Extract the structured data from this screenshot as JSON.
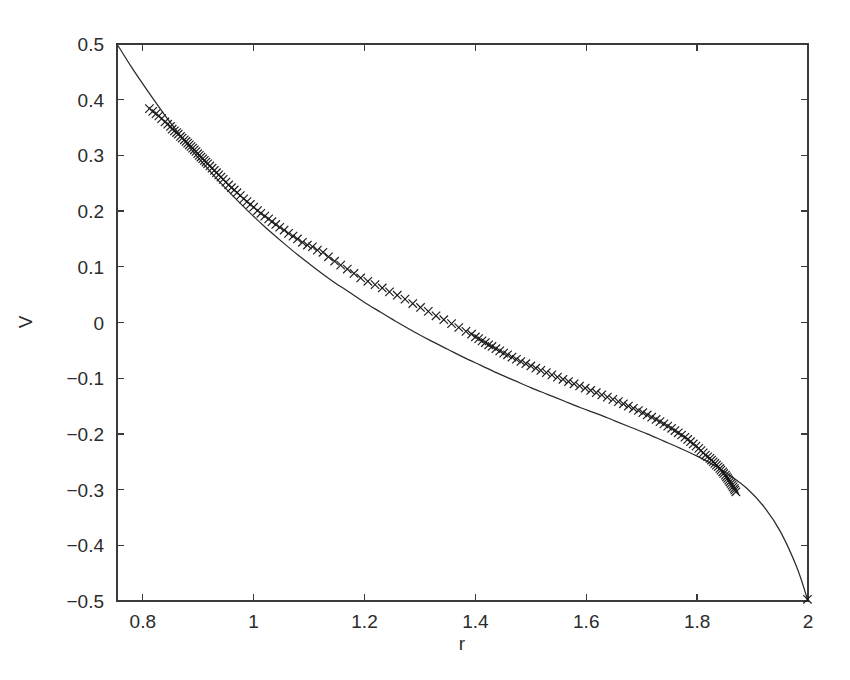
{
  "chart_data": {
    "type": "scatter",
    "title": "",
    "xlabel": "r",
    "ylabel": "V",
    "xlim": [
      0.7535,
      2.0
    ],
    "ylim": [
      -0.5,
      0.5
    ],
    "grid": false,
    "legend": null,
    "xticks": [
      0.8,
      1.0,
      1.2,
      1.4,
      1.6,
      1.8,
      2.0
    ],
    "xticklabels": [
      "0.8",
      "1",
      "1.2",
      "1.4",
      "1.6",
      "1.8",
      "2"
    ],
    "yticks": [
      -0.5,
      -0.4,
      -0.3,
      -0.2,
      -0.1,
      0.0,
      0.1,
      0.2,
      0.3,
      0.4,
      0.5
    ],
    "yticklabels": [
      "−0.5",
      "−0.4",
      "−0.3",
      "−0.2",
      "−0.1",
      "0",
      "0.1",
      "0.2",
      "0.3",
      "0.4",
      "0.5"
    ],
    "series": [
      {
        "name": "fit curve",
        "type": "line",
        "marker": "none",
        "linestyle": "solid",
        "color": "#2b2b2b",
        "x": [
          0.7535,
          0.78,
          0.81,
          0.84,
          0.87,
          0.9,
          0.93,
          0.96,
          0.99,
          1.02,
          1.05,
          1.08,
          1.11,
          1.14,
          1.17,
          1.2,
          1.23,
          1.26,
          1.29,
          1.32,
          1.35,
          1.38,
          1.41,
          1.44,
          1.47,
          1.5,
          1.53,
          1.56,
          1.59,
          1.62,
          1.65,
          1.68,
          1.71,
          1.74,
          1.77,
          1.8,
          1.83,
          1.86,
          1.89,
          1.92,
          1.95,
          1.98,
          2.0
        ],
        "y": [
          0.5,
          0.458,
          0.414,
          0.372,
          0.333,
          0.296,
          0.262,
          0.23,
          0.2,
          0.172,
          0.146,
          0.121,
          0.098,
          0.076,
          0.056,
          0.036,
          0.018,
          0.0,
          -0.017,
          -0.033,
          -0.048,
          -0.063,
          -0.077,
          -0.091,
          -0.104,
          -0.117,
          -0.129,
          -0.141,
          -0.153,
          -0.164,
          -0.176,
          -0.188,
          -0.2,
          -0.213,
          -0.226,
          -0.24,
          -0.256,
          -0.275,
          -0.298,
          -0.33,
          -0.375,
          -0.44,
          -0.5
        ]
      },
      {
        "name": "data points",
        "type": "scatter",
        "marker": "x",
        "color": "#1a1a1a",
        "x": [
          0.812,
          0.818,
          0.824,
          0.829,
          0.834,
          0.84,
          0.845,
          0.85,
          0.853,
          0.857,
          0.861,
          0.864,
          0.868,
          0.871,
          0.875,
          0.878,
          0.881,
          0.884,
          0.887,
          0.89,
          0.893,
          0.896,
          0.899,
          0.902,
          0.905,
          0.908,
          0.911,
          0.914,
          0.917,
          0.921,
          0.925,
          0.929,
          0.933,
          0.937,
          0.941,
          0.945,
          0.95,
          0.955,
          0.96,
          0.965,
          0.97,
          0.976,
          0.982,
          0.988,
          0.994,
          1.0,
          1.007,
          1.013,
          1.02,
          1.027,
          1.033,
          1.04,
          1.047,
          1.055,
          1.063,
          1.071,
          1.079,
          1.088,
          1.097,
          1.106,
          1.115,
          1.125,
          1.135,
          1.146,
          1.157,
          1.169,
          1.181,
          1.193,
          1.206,
          1.219,
          1.232,
          1.245,
          1.259,
          1.273,
          1.287,
          1.301,
          1.315,
          1.329,
          1.343,
          1.357,
          1.37,
          1.383,
          1.393,
          1.4,
          1.406,
          1.412,
          1.418,
          1.424,
          1.43,
          1.437,
          1.444,
          1.451,
          1.458,
          1.466,
          1.474,
          1.482,
          1.491,
          1.5,
          1.509,
          1.518,
          1.528,
          1.538,
          1.548,
          1.558,
          1.568,
          1.578,
          1.588,
          1.598,
          1.608,
          1.618,
          1.628,
          1.638,
          1.648,
          1.658,
          1.667,
          1.676,
          1.685,
          1.694,
          1.702,
          1.71,
          1.718,
          1.726,
          1.733,
          1.74,
          1.747,
          1.754,
          1.76,
          1.766,
          1.772,
          1.778,
          1.783,
          1.788,
          1.793,
          1.798,
          1.803,
          1.807,
          1.811,
          1.815,
          1.819,
          1.823,
          1.826,
          1.829,
          1.832,
          1.835,
          1.838,
          1.841,
          1.843,
          1.846,
          1.848,
          1.851,
          1.853,
          1.855,
          1.857,
          1.859,
          1.861,
          1.863,
          1.865,
          1.867,
          1.868,
          1.87,
          1.999
        ],
        "y": [
          0.384,
          0.379,
          0.375,
          0.371,
          0.366,
          0.36,
          0.356,
          0.352,
          0.347,
          0.344,
          0.341,
          0.338,
          0.334,
          0.331,
          0.328,
          0.325,
          0.322,
          0.319,
          0.316,
          0.313,
          0.31,
          0.307,
          0.303,
          0.3,
          0.297,
          0.294,
          0.291,
          0.288,
          0.285,
          0.281,
          0.277,
          0.273,
          0.269,
          0.265,
          0.261,
          0.257,
          0.252,
          0.247,
          0.242,
          0.238,
          0.233,
          0.228,
          0.222,
          0.217,
          0.212,
          0.207,
          0.201,
          0.196,
          0.191,
          0.186,
          0.181,
          0.176,
          0.171,
          0.166,
          0.16,
          0.155,
          0.15,
          0.144,
          0.139,
          0.136,
          0.13,
          0.126,
          0.118,
          0.11,
          0.103,
          0.096,
          0.088,
          0.08,
          0.074,
          0.068,
          0.062,
          0.055,
          0.049,
          0.042,
          0.034,
          0.027,
          0.02,
          0.012,
          0.005,
          -0.002,
          -0.009,
          -0.016,
          -0.021,
          -0.026,
          -0.029,
          -0.033,
          -0.036,
          -0.04,
          -0.043,
          -0.047,
          -0.051,
          -0.055,
          -0.058,
          -0.062,
          -0.066,
          -0.07,
          -0.074,
          -0.078,
          -0.082,
          -0.086,
          -0.09,
          -0.094,
          -0.098,
          -0.102,
          -0.106,
          -0.11,
          -0.114,
          -0.118,
          -0.122,
          -0.126,
          -0.13,
          -0.134,
          -0.138,
          -0.142,
          -0.146,
          -0.15,
          -0.154,
          -0.158,
          -0.162,
          -0.166,
          -0.17,
          -0.174,
          -0.178,
          -0.182,
          -0.186,
          -0.19,
          -0.194,
          -0.198,
          -0.202,
          -0.206,
          -0.21,
          -0.214,
          -0.218,
          -0.222,
          -0.226,
          -0.23,
          -0.234,
          -0.238,
          -0.241,
          -0.244,
          -0.247,
          -0.25,
          -0.253,
          -0.256,
          -0.259,
          -0.262,
          -0.265,
          -0.268,
          -0.271,
          -0.274,
          -0.277,
          -0.28,
          -0.283,
          -0.286,
          -0.289,
          -0.292,
          -0.295,
          -0.298,
          -0.301,
          -0.304,
          -0.497
        ]
      }
    ]
  },
  "axes": {
    "left_px": 117,
    "right_px": 808,
    "top_px": 44,
    "bottom_px": 601,
    "frame_color": "#3a3a3a",
    "tick_direction": "in"
  }
}
